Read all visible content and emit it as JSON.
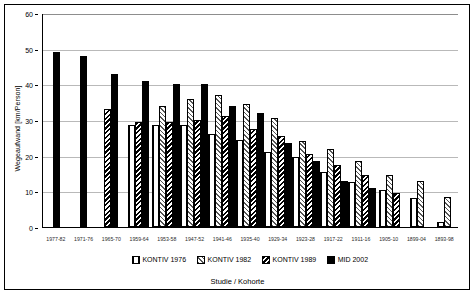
{
  "chart_data": {
    "type": "bar",
    "title": "",
    "xlabel": "Studie / Kohorte",
    "ylabel": "Wegeaufwand [km/Person]",
    "ylim": [
      0,
      60
    ],
    "yticks": [
      0,
      10,
      20,
      30,
      40,
      50,
      60
    ],
    "grid": true,
    "legend_position": "bottom",
    "categories": [
      "1977-82",
      "1971-76",
      "1965-70",
      "1959-64",
      "1953-58",
      "1947-52",
      "1941-46",
      "1935-40",
      "1929-34",
      "1923-28",
      "1917-22",
      "1911-16",
      "1905-10",
      "1899-04",
      "1893-98"
    ],
    "series": [
      {
        "name": "KONTIV 1976",
        "pattern": "vertical-dotted",
        "values": [
          null,
          null,
          null,
          28.5,
          28.5,
          28.5,
          26,
          24.5,
          21,
          19.5,
          15.5,
          12.5,
          10.5,
          8,
          1.5
        ]
      },
      {
        "name": "KONTIV 1982",
        "pattern": "diagonal-light",
        "values": [
          null,
          null,
          null,
          null,
          34,
          36,
          37,
          34.5,
          30.5,
          24,
          22,
          18.5,
          14.5,
          13,
          8.5
        ]
      },
      {
        "name": "KONTIV 1989",
        "pattern": "diagonal-dark",
        "values": [
          null,
          null,
          33,
          29.5,
          29.5,
          30,
          31,
          27.5,
          25.5,
          20.5,
          17.5,
          14.5,
          9.5,
          null,
          null
        ]
      },
      {
        "name": "MID 2002",
        "pattern": "solid-black",
        "values": [
          49,
          48,
          43,
          41,
          40,
          40,
          34,
          32,
          23.5,
          18.5,
          13,
          11,
          null,
          null,
          null
        ]
      }
    ]
  },
  "legend": {
    "items": [
      {
        "label": "KONTIV 1976"
      },
      {
        "label": "KONTIV 1982"
      },
      {
        "label": "KONTIV 1989"
      },
      {
        "label": "MID 2002"
      }
    ]
  }
}
